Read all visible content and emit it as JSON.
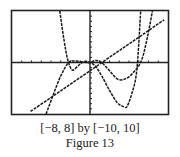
{
  "figure": {
    "range_label": "[−8, 8] by [−10, 10]",
    "caption": "Figure 13"
  },
  "chart_data": {
    "type": "line",
    "title": "Figure 13",
    "subtitle": "[-8, 8] by [-10, 10]",
    "xlabel": "",
    "ylabel": "",
    "xlim": [
      -8,
      8
    ],
    "ylim": [
      -10,
      10
    ],
    "xticks_step": 1,
    "yticks_step": 1,
    "grid": false,
    "legend": "none",
    "style": "graphing-calculator, dashed/pixelated black curves",
    "series": [
      {
        "name": "line",
        "x": [
          -6.1,
          -4,
          -2,
          0,
          2,
          4,
          6,
          7.6
        ],
        "y": [
          -9.5,
          -6.8,
          -4.2,
          -1.6,
          1.0,
          3.6,
          6.2,
          8.3
        ]
      },
      {
        "name": "curve-deep-minimum",
        "x": [
          -3.1,
          -2.8,
          -2.5,
          -2.2,
          -1.8,
          -1.2,
          -0.6,
          0,
          0.6,
          1.2,
          2,
          2.8,
          3.5,
          3.8,
          4.3,
          4.8,
          5.2
        ],
        "y": [
          10,
          6,
          2.5,
          0,
          -1.5,
          -0.6,
          0.2,
          0,
          -0.8,
          -2.6,
          -5.4,
          -7.8,
          -8.6,
          -8.5,
          -6,
          -1.5,
          10
        ]
      },
      {
        "name": "curve-shallow-minimum",
        "x": [
          -4.5,
          -3.8,
          -3.0,
          -2.2,
          -1.6,
          -1.0,
          -0.4,
          0,
          0.6,
          1.2,
          2.0,
          2.9,
          3.8,
          4.6,
          5.3,
          5.9,
          6.4
        ],
        "y": [
          -10,
          -6.4,
          -2.6,
          0,
          0.3,
          0.2,
          0,
          0,
          0.4,
          0,
          -1.6,
          -3.3,
          -3.0,
          -1.6,
          0.5,
          5.0,
          10
        ]
      }
    ]
  }
}
